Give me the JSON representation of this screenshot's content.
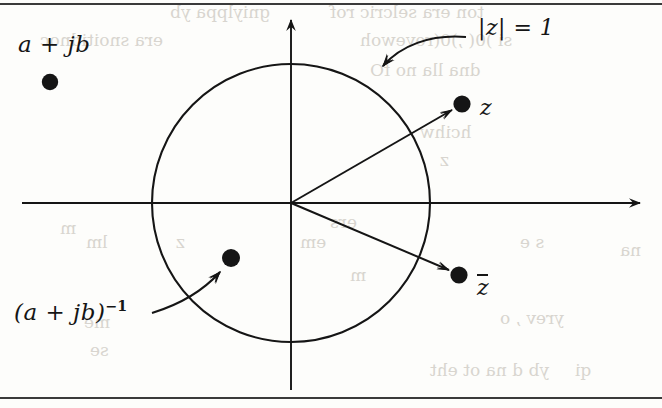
{
  "figure": {
    "background_color": "#fdfdfb",
    "ink_color": "#151515",
    "width": 662,
    "height": 408,
    "labels": {
      "point_a_plus_jb": "a + jb",
      "unit_circle": "|z| = 1",
      "point_z": "z",
      "point_z_conjugate": "z",
      "point_inverse": "(a + jb)",
      "inverse_exponent": "−1"
    },
    "axes": {
      "horizontal": {
        "y": 203,
        "x_start": 22,
        "x_end": 645,
        "arrow": "right"
      },
      "vertical": {
        "x": 291,
        "y_start": 14,
        "y_end": 390,
        "arrow": "up"
      }
    },
    "circle": {
      "center_x": 291,
      "center_y": 203,
      "radius": 139,
      "label": "|z| = 1"
    },
    "points": [
      {
        "name": "a + jb",
        "x": 50,
        "y": 82,
        "inside_circle": false
      },
      {
        "name": "z",
        "x": 462,
        "y": 104,
        "inside_circle": false
      },
      {
        "name": "z-conjugate",
        "x": 459,
        "y": 275,
        "inside_circle": false
      },
      {
        "name": "(a + jb)^-1",
        "x": 231,
        "y": 258,
        "inside_circle": true
      }
    ],
    "rays": [
      {
        "from": "origin",
        "to": "z"
      },
      {
        "from": "origin",
        "to": "z-conjugate"
      }
    ],
    "annotation_arrows": [
      {
        "label": "|z| = 1",
        "points_to": "unit-circle"
      },
      {
        "label": "(a + jb)^-1",
        "points_to": "inverse-point"
      }
    ],
    "borders": {
      "top_rule_y": 4,
      "bottom_rule_y": 398
    },
    "bleed_through": [
      {
        "text": "gniylppa yb",
        "x": 170,
        "y": 2
      },
      {
        "text": "era snoitidnoc",
        "x": 40,
        "y": 30
      },
      {
        "text": "ton era selcric rof",
        "x": 330,
        "y": 2
      },
      {
        "text": "si )0( ,)0(revewoh",
        "x": 360,
        "y": 30
      },
      {
        "text": "dna lla no fO",
        "x": 370,
        "y": 60
      },
      {
        "text": "hcihw",
        "x": 420,
        "y": 122
      },
      {
        "text": "z",
        "x": 440,
        "y": 150
      },
      {
        "text": "m",
        "x": 60,
        "y": 218
      },
      {
        "text": "ers",
        "x": 330,
        "y": 212
      },
      {
        "text": "z",
        "x": 176,
        "y": 232
      },
      {
        "text": "lm",
        "x": 86,
        "y": 232
      },
      {
        "text": "s e",
        "x": 520,
        "y": 232
      },
      {
        "text": "em",
        "x": 300,
        "y": 232
      },
      {
        "text": "na",
        "x": 620,
        "y": 240
      },
      {
        "text": "m",
        "x": 350,
        "y": 265
      },
      {
        "text": "yrev , o",
        "x": 500,
        "y": 308
      },
      {
        "text": "me",
        "x": 84,
        "y": 312
      },
      {
        "text": "se",
        "x": 90,
        "y": 340
      },
      {
        "text": "yb d na ot eht",
        "x": 430,
        "y": 360
      },
      {
        "text": "qi",
        "x": 575,
        "y": 360
      }
    ]
  }
}
